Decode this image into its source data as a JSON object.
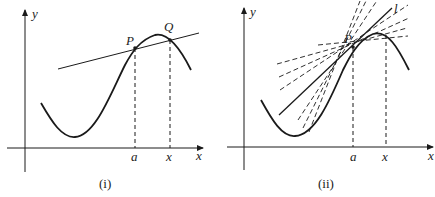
{
  "figure": {
    "panels": [
      {
        "id": "i",
        "caption": "(i)",
        "axis_labels": {
          "x": "x",
          "y": "y"
        },
        "points": {
          "P": "P",
          "Q": "Q"
        },
        "tick_labels": {
          "a": "a",
          "x": "x"
        },
        "description": "Curve with secant line through points P and Q"
      },
      {
        "id": "ii",
        "caption": "(ii)",
        "axis_labels": {
          "x": "x",
          "y": "y"
        },
        "points": {
          "P": "P"
        },
        "line_label": "l",
        "tick_labels": {
          "a": "a",
          "x": "x"
        },
        "description": "Secant lines (dashed) approaching tangent line l at P"
      }
    ],
    "colors": {
      "stroke": "#1a1a1a",
      "background": "#ffffff"
    }
  }
}
